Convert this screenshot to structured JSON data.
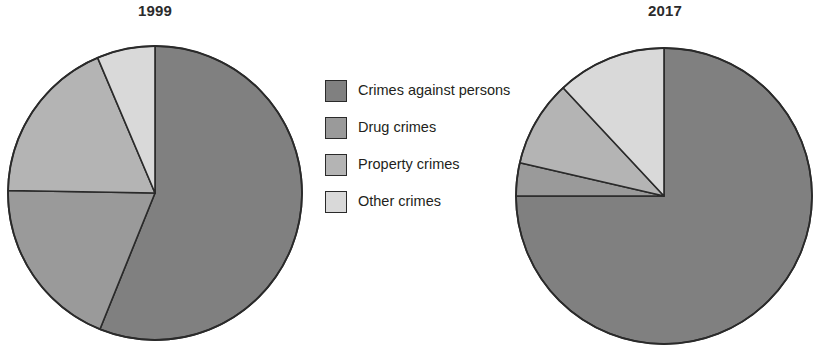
{
  "chart_data": {
    "type": "pie",
    "title": "",
    "categories": [
      "Crimes against persons",
      "Drug crimes",
      "Property crimes",
      "Other crimes"
    ],
    "colors": [
      "#808080",
      "#9a9a9a",
      "#b4b4b4",
      "#d9d9d9"
    ],
    "outline_color": "#2a2a2a",
    "legend_position": "center",
    "charts": [
      {
        "title": "1999",
        "values": [
          56,
          19,
          18,
          7
        ],
        "start_angle_deg": 0,
        "direction": "clockwise",
        "slices": [
          {
            "label": "Crimes against persons",
            "value": 56,
            "start_deg": 0,
            "end_deg": 202,
            "color": "#808080"
          },
          {
            "label": "Drug crimes",
            "value": 19,
            "start_deg": 202,
            "end_deg": 271,
            "color": "#9a9a9a"
          },
          {
            "label": "Property crimes",
            "value": 18,
            "start_deg": 271,
            "end_deg": 337,
            "color": "#b4b4b4"
          },
          {
            "label": "Other crimes",
            "value": 7,
            "start_deg": 337,
            "end_deg": 360,
            "color": "#d9d9d9"
          }
        ]
      },
      {
        "title": "2017",
        "values": [
          75,
          4,
          9,
          12
        ],
        "start_angle_deg": 0,
        "direction": "clockwise",
        "slices": [
          {
            "label": "Crimes against persons",
            "value": 75,
            "start_deg": 0,
            "end_deg": 270,
            "color": "#808080"
          },
          {
            "label": "Drug crimes",
            "value": 4,
            "start_deg": 270,
            "end_deg": 283,
            "color": "#9a9a9a"
          },
          {
            "label": "Property crimes",
            "value": 9,
            "start_deg": 283,
            "end_deg": 317,
            "color": "#b4b4b4"
          },
          {
            "label": "Other crimes",
            "value": 12,
            "start_deg": 317,
            "end_deg": 360,
            "color": "#d9d9d9"
          }
        ]
      }
    ]
  },
  "charts": {
    "left": {
      "title": "1999"
    },
    "right": {
      "title": "2017"
    }
  },
  "legend": {
    "items": [
      {
        "label": "Crimes against persons",
        "color": "#808080"
      },
      {
        "label": "Drug crimes",
        "color": "#9a9a9a"
      },
      {
        "label": "Property crimes",
        "color": "#b4b4b4"
      },
      {
        "label": "Other crimes",
        "color": "#d9d9d9"
      }
    ]
  }
}
